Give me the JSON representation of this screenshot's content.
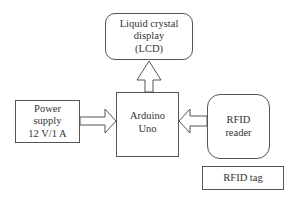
{
  "diagram": {
    "lcd": {
      "lines": [
        "Liquid crystal",
        "display",
        "(LCD)"
      ]
    },
    "power": {
      "lines": [
        "Power",
        "supply",
        "12 V/1 A"
      ]
    },
    "arduino": {
      "lines": [
        "Arduino",
        "Uno"
      ]
    },
    "rfid_reader": {
      "lines": [
        "RFID",
        "reader"
      ]
    },
    "rfid_tag": {
      "label": "RFID tag"
    },
    "arrows": [
      {
        "from": "arduino",
        "to": "lcd",
        "direction": "up"
      },
      {
        "from": "power",
        "to": "arduino",
        "direction": "right"
      },
      {
        "from": "rfid_reader",
        "to": "arduino",
        "direction": "left"
      }
    ],
    "colors": {
      "stroke": "#555555",
      "text": "#333333",
      "background": "#ffffff"
    }
  }
}
